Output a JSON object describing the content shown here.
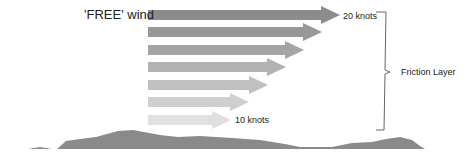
{
  "diagram": {
    "title_label": "'FREE' wind",
    "top_speed_label": "20 knots",
    "bottom_speed_label": "10 knots",
    "layer_label": "Friction Layer",
    "arrows": [
      {
        "y": 15,
        "tip": 340,
        "color": "#8c8c8c"
      },
      {
        "y": 32,
        "tip": 322,
        "color": "#979797"
      },
      {
        "y": 50,
        "tip": 304,
        "color": "#a4a4a4"
      },
      {
        "y": 67,
        "tip": 286,
        "color": "#b2b2b2"
      },
      {
        "y": 85,
        "tip": 268,
        "color": "#c0c0c0"
      },
      {
        "y": 102,
        "tip": 249,
        "color": "#cfcfcf"
      },
      {
        "y": 120,
        "tip": 231,
        "color": "#e0e0e0"
      }
    ],
    "ground_color": "#8a8a8a"
  }
}
